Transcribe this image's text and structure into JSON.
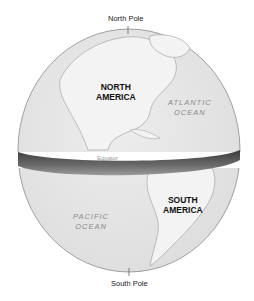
{
  "diagram": {
    "type": "globe-equator",
    "labels": {
      "north_pole": "North Pole",
      "south_pole": "South Pole",
      "equator": "Equator",
      "north_america_line1": "NORTH",
      "north_america_line2": "AMERICA",
      "south_america_line1": "SOUTH",
      "south_america_line2": "AMERICA",
      "atlantic_line1": "ATLANTIC",
      "atlantic_line2": "OCEAN",
      "pacific_line1": "PACIFIC",
      "pacific_line2": "OCEAN"
    },
    "colors": {
      "ocean": "#e6e6e6",
      "land": "#f2f2f2",
      "coast": "#9a9a9a",
      "band_dark": "#3c3c3c",
      "band_light": "#8c8c8c"
    }
  }
}
